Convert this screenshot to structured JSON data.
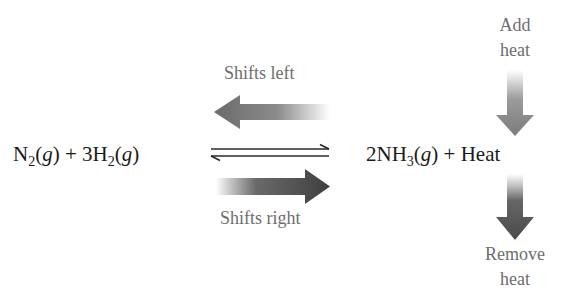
{
  "reactants": {
    "n2": {
      "symbol": "N",
      "sub": "2",
      "state": "g"
    },
    "plus": "+",
    "h2": {
      "coef": "3",
      "symbol": "H",
      "sub": "2",
      "state": "g"
    }
  },
  "products": {
    "nh3": {
      "coef": "2",
      "symbol": "NH",
      "sub": "3",
      "state": "g"
    },
    "plus": "+",
    "heat": "Heat"
  },
  "shift_labels": {
    "left": "Shifts left",
    "right": "Shifts right"
  },
  "heat_labels": {
    "add_line1": "Add",
    "add_line2": "heat",
    "remove_line1": "Remove",
    "remove_line2": "heat"
  },
  "colors": {
    "arrow_dark": "#505050",
    "arrow_mid": "#7a7a7a",
    "label_gray": "#6e6e6e",
    "text": "#1a1a1a"
  }
}
